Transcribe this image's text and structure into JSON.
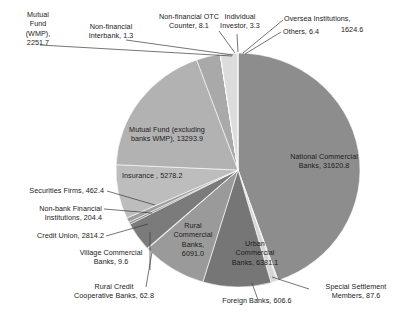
{
  "chart_data": {
    "type": "pie",
    "title": "",
    "subtitle": "",
    "xlabel": "",
    "ylabel": "",
    "legend_position": "none",
    "grid": false,
    "labels_show_value": true,
    "total": 78898.3,
    "categories": [
      "National Commercial Banks",
      "Special Settlement Members",
      "Foreign Banks",
      "Urban Commercial Banks",
      "Rural Commercial Banks",
      "Rural Credit Cooperative Banks",
      "Village Commercial Banks",
      "Credit Union",
      "Non-bank Financial Institutions",
      "Securities Firms",
      "Insurance",
      "Mutual Fund (excluding banks WMP)",
      "Mutual Fund (WMP)",
      "Non-financial Interbank",
      "Non-financial OTC Counter",
      "Individual Investor",
      "Oversea Institutions",
      "Others"
    ],
    "values": [
      31620.8,
      87.6,
      606.6,
      6381.1,
      6091.0,
      62.8,
      9.6,
      2814.2,
      204.4,
      462.4,
      5278.2,
      13293.9,
      2251.7,
      1.3,
      8.1,
      3.3,
      1624.6,
      6.4
    ],
    "colors": [
      "#8d8d8d",
      "#c9c9c9",
      "#d6d6d6",
      "#767676",
      "#9a9a9a",
      "#6f6f6f",
      "#818181",
      "#7b7b7b",
      "#8a8a8a",
      "#9e9e9e",
      "#bdbdbd",
      "#b2b2b2",
      "#a9a9a9",
      "#c0c0c0",
      "#b8b8b8",
      "#cfcfcf",
      "#dcdcdc",
      "#c4c4c4"
    ]
  },
  "labels": {
    "mutual_fund_wmp": "Mutual\nFund\n(WMP),\n2251.7",
    "non_financial_interbank": "Non-financial\nInterbank, 1.3",
    "non_financial_otc": "Non-financial OTC\nCounter, 8.1",
    "individual_investor": "Individual\nInvestor, 3.3",
    "oversea_institutions": "Oversea Institutions,",
    "oversea_institutions_value": "1624.6",
    "others": "Others, 6.4",
    "national_commercial_banks": "National Commercial\nBanks, 31620.8",
    "mutual_fund_excluding": "Mutual Fund (excluding\nbanks WMP), 13293.9",
    "insurance": "Insurance , 5278.2",
    "securities_firms": "Securities Firms, 462.4",
    "non_bank_financial": "Non-bank Financial\nInstitutions, 204.4",
    "credit_union": "Credit Union, 2814.2",
    "village_commercial_banks": "Village Commercial\nBanks, 9.6",
    "rural_credit_cooperative": "Rural Credit\nCooperative Banks, 62.8",
    "rural_commercial_banks": "Rural\nCommercial\nBanks,\n6091.0",
    "urban_commercial_banks": "Urban\nCommercial\nBanks, 6381.1",
    "foreign_banks": "Foreign Banks, 606.6",
    "special_settlement": "Special Settlement\nMembers, 87.6"
  }
}
